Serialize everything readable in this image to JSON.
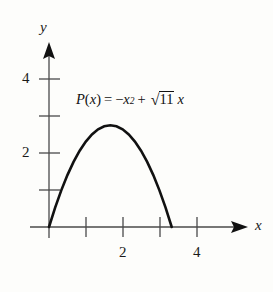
{
  "figure": {
    "background_color": "#fdfdfb",
    "ink_color": "#1a1a1a",
    "curve_color": "#111111",
    "width": 273,
    "height": 292
  },
  "equation": {
    "full_text": "P(x) = -x^2 + sqrt(11) x",
    "function_name": "P",
    "paren_open": "(",
    "variable": "x",
    "paren_close": ")",
    "equals": "=",
    "minus": "−",
    "squared_base": "x",
    "exponent": "2",
    "plus": "+",
    "radical_sign": "√",
    "radicand": "11",
    "trailing_variable": "x"
  },
  "axes": {
    "x_axis_label": "x",
    "y_axis_label": "y",
    "x_ticks": [
      {
        "value": 1,
        "label": ""
      },
      {
        "value": 2,
        "label": "2"
      },
      {
        "value": 3,
        "label": ""
      },
      {
        "value": 4,
        "label": "4"
      }
    ],
    "y_ticks": [
      {
        "value": 1,
        "label": ""
      },
      {
        "value": 2,
        "label": "2"
      },
      {
        "value": 3,
        "label": ""
      },
      {
        "value": 4,
        "label": "4"
      }
    ]
  },
  "chart_data": {
    "type": "line",
    "title": "",
    "xlabel": "x",
    "ylabel": "y",
    "xlim": [
      -0.25,
      5.4
    ],
    "ylim": [
      -0.3,
      5.1
    ],
    "grid": false,
    "legend": "none",
    "annotations": [
      {
        "text": "P(x) = −x² + √11 x",
        "x": 0.75,
        "y": 3.6
      }
    ],
    "series": [
      {
        "name": "P(x) = -x^2 + sqrt(11)x",
        "equation": "y = -x^2 + 11^(1/2) * x",
        "roots": [
          0,
          3.3166
        ],
        "vertex": [
          1.6583,
          2.75
        ],
        "x": [
          0,
          0.1658,
          0.3317,
          0.4975,
          0.6633,
          0.8292,
          0.995,
          1.1608,
          1.3267,
          1.4925,
          1.6583,
          1.8242,
          1.99,
          2.1558,
          2.3217,
          2.4875,
          2.6533,
          2.8191,
          2.985,
          3.1508,
          3.3166
        ],
        "values": [
          0,
          0.522,
          0.99,
          1.402,
          1.76,
          2.063,
          2.31,
          2.502,
          2.64,
          2.722,
          2.75,
          2.722,
          2.64,
          2.502,
          2.31,
          2.063,
          1.76,
          1.402,
          0.99,
          0.522,
          0
        ]
      }
    ]
  }
}
